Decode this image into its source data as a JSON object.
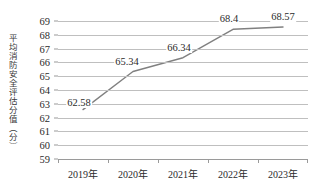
{
  "chart_data": {
    "type": "line",
    "title": "",
    "subtitle": "",
    "xlabel": "",
    "ylabel": "平均消防安全评估分值（分）",
    "categories": [
      "2019年",
      "2020年",
      "2021年",
      "2022年",
      "2023年"
    ],
    "values": [
      62.58,
      65.34,
      66.34,
      68.4,
      68.57
    ],
    "data_labels": [
      "62.58",
      "65.34",
      "66.34",
      "68.4",
      "68.57"
    ],
    "series": [
      {
        "name": "平均消防安全评估分值",
        "values": [
          62.58,
          65.34,
          66.34,
          68.4,
          68.57
        ]
      }
    ],
    "ylim": [
      59,
      69
    ],
    "y_ticks": [
      59,
      60,
      61,
      62,
      63,
      64,
      65,
      66,
      67,
      68,
      69
    ],
    "y_tick_labels": [
      "59",
      "60",
      "61",
      "62",
      "63",
      "64",
      "65",
      "66",
      "67",
      "68",
      "69"
    ],
    "grid": true,
    "grid_axis": "y",
    "legend": false,
    "legend_position": "none",
    "markers": false,
    "colors": {
      "line": "#808080",
      "gridline": "#bfbfbf",
      "axis": "#9a9a9a",
      "text": "#2b2b2b",
      "background": "#ffffff"
    },
    "line_width": 1.4,
    "annotations": []
  }
}
